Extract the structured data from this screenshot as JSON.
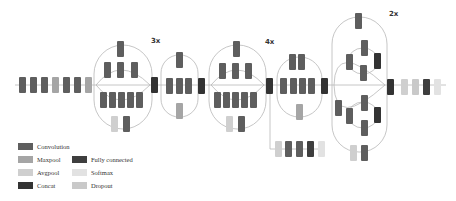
{
  "colors": {
    "convolution": "#5e5e5e",
    "maxpool": "#a5a5a5",
    "avgpool": "#cfcfcf",
    "concat": "#333333",
    "fully_connected": "#3e3e3e",
    "softmax": "#e2e2e2",
    "dropout": "#c9c9c9",
    "line": "#b0b0b0"
  },
  "labels": {
    "inception_a_repeat": "3x",
    "inception_b_repeat": "4x",
    "inception_c_repeat": "2x"
  },
  "legend": {
    "items": [
      {
        "label": "Convolution",
        "type": "convolution"
      },
      {
        "label": "Maxpool",
        "type": "maxpool"
      },
      {
        "label": "Avgpool",
        "type": "avgpool"
      },
      {
        "label": "Concat",
        "type": "concat"
      },
      {
        "label": "Fully connected",
        "type": "fully_connected"
      },
      {
        "label": "Softmax",
        "type": "softmax"
      },
      {
        "label": "Dropout",
        "type": "dropout"
      }
    ]
  },
  "blocks": [
    {
      "section": "stem",
      "type": "convolution",
      "x": 19,
      "y": 77
    },
    {
      "section": "stem",
      "type": "convolution",
      "x": 30,
      "y": 77
    },
    {
      "section": "stem",
      "type": "convolution",
      "x": 41,
      "y": 77
    },
    {
      "section": "stem",
      "type": "maxpool",
      "x": 52,
      "y": 77
    },
    {
      "section": "stem",
      "type": "convolution",
      "x": 63,
      "y": 77
    },
    {
      "section": "stem",
      "type": "convolution",
      "x": 74,
      "y": 77
    },
    {
      "section": "stem",
      "type": "maxpool",
      "x": 85,
      "y": 77
    },
    {
      "section": "inception-a",
      "type": "convolution",
      "x": 117,
      "y": 41
    },
    {
      "section": "inception-a",
      "type": "convolution",
      "x": 104,
      "y": 62
    },
    {
      "section": "inception-a",
      "type": "convolution",
      "x": 117,
      "y": 62
    },
    {
      "section": "inception-a",
      "type": "convolution",
      "x": 131,
      "y": 62
    },
    {
      "section": "inception-a",
      "type": "convolution",
      "x": 100,
      "y": 92
    },
    {
      "section": "inception-a",
      "type": "convolution",
      "x": 109,
      "y": 92
    },
    {
      "section": "inception-a",
      "type": "convolution",
      "x": 118,
      "y": 92
    },
    {
      "section": "inception-a",
      "type": "convolution",
      "x": 127,
      "y": 92
    },
    {
      "section": "inception-a",
      "type": "convolution",
      "x": 136,
      "y": 92
    },
    {
      "section": "inception-a",
      "type": "avgpool",
      "x": 111,
      "y": 116
    },
    {
      "section": "inception-a",
      "type": "convolution",
      "x": 123,
      "y": 116
    },
    {
      "section": "inception-a",
      "type": "concat",
      "x": 151,
      "y": 77
    },
    {
      "section": "reduction-a",
      "type": "convolution",
      "x": 176,
      "y": 52
    },
    {
      "section": "reduction-a",
      "type": "convolution",
      "x": 166,
      "y": 78
    },
    {
      "section": "reduction-a",
      "type": "convolution",
      "x": 176,
      "y": 78
    },
    {
      "section": "reduction-a",
      "type": "convolution",
      "x": 185,
      "y": 78
    },
    {
      "section": "reduction-a",
      "type": "maxpool",
      "x": 176,
      "y": 103
    },
    {
      "section": "reduction-a",
      "type": "concat",
      "x": 198,
      "y": 78
    },
    {
      "section": "inception-b",
      "type": "convolution",
      "x": 233,
      "y": 41
    },
    {
      "section": "inception-b",
      "type": "convolution",
      "x": 219,
      "y": 63
    },
    {
      "section": "inception-b",
      "type": "convolution",
      "x": 232,
      "y": 63
    },
    {
      "section": "inception-b",
      "type": "convolution",
      "x": 245,
      "y": 63
    },
    {
      "section": "inception-b",
      "type": "convolution",
      "x": 214,
      "y": 92
    },
    {
      "section": "inception-b",
      "type": "convolution",
      "x": 223,
      "y": 92
    },
    {
      "section": "inception-b",
      "type": "convolution",
      "x": 232,
      "y": 92
    },
    {
      "section": "inception-b",
      "type": "convolution",
      "x": 241,
      "y": 92
    },
    {
      "section": "inception-b",
      "type": "convolution",
      "x": 250,
      "y": 92
    },
    {
      "section": "inception-b",
      "type": "avgpool",
      "x": 226,
      "y": 116
    },
    {
      "section": "inception-b",
      "type": "convolution",
      "x": 238,
      "y": 116
    },
    {
      "section": "inception-b",
      "type": "concat",
      "x": 266,
      "y": 78
    },
    {
      "section": "auxiliary",
      "type": "avgpool",
      "x": 275,
      "y": 141
    },
    {
      "section": "auxiliary",
      "type": "convolution",
      "x": 285,
      "y": 141
    },
    {
      "section": "auxiliary",
      "type": "convolution",
      "x": 296,
      "y": 141
    },
    {
      "section": "auxiliary",
      "type": "fully_connected",
      "x": 307,
      "y": 141
    },
    {
      "section": "auxiliary",
      "type": "softmax",
      "x": 318,
      "y": 141
    },
    {
      "section": "reduction-b",
      "type": "convolution",
      "x": 289,
      "y": 54
    },
    {
      "section": "reduction-b",
      "type": "convolution",
      "x": 298,
      "y": 54
    },
    {
      "section": "reduction-b",
      "type": "convolution",
      "x": 280,
      "y": 78
    },
    {
      "section": "reduction-b",
      "type": "convolution",
      "x": 290,
      "y": 78
    },
    {
      "section": "reduction-b",
      "type": "convolution",
      "x": 299,
      "y": 78
    },
    {
      "section": "reduction-b",
      "type": "convolution",
      "x": 308,
      "y": 78
    },
    {
      "section": "reduction-b",
      "type": "maxpool",
      "x": 296,
      "y": 104
    },
    {
      "section": "reduction-b",
      "type": "concat",
      "x": 321,
      "y": 78
    },
    {
      "section": "inception-c",
      "type": "convolution",
      "x": 355,
      "y": 13
    },
    {
      "section": "inception-c",
      "type": "convolution",
      "x": 346,
      "y": 54
    },
    {
      "section": "inception-c",
      "type": "convolution",
      "x": 361,
      "y": 40
    },
    {
      "section": "inception-c",
      "type": "convolution",
      "x": 360,
      "y": 65
    },
    {
      "section": "inception-c",
      "type": "concat",
      "x": 374,
      "y": 53
    },
    {
      "section": "inception-c",
      "type": "convolution",
      "x": 335,
      "y": 100
    },
    {
      "section": "inception-c",
      "type": "convolution",
      "x": 346,
      "y": 108
    },
    {
      "section": "inception-c",
      "type": "convolution",
      "x": 361,
      "y": 95
    },
    {
      "section": "inception-c",
      "type": "convolution",
      "x": 361,
      "y": 120
    },
    {
      "section": "inception-c",
      "type": "concat",
      "x": 374,
      "y": 107
    },
    {
      "section": "inception-c",
      "type": "avgpool",
      "x": 350,
      "y": 145
    },
    {
      "section": "inception-c",
      "type": "convolution",
      "x": 361,
      "y": 145
    },
    {
      "section": "inception-c",
      "type": "concat",
      "x": 387,
      "y": 79
    },
    {
      "section": "output",
      "type": "avgpool",
      "x": 401,
      "y": 79
    },
    {
      "section": "output",
      "type": "dropout",
      "x": 412,
      "y": 79
    },
    {
      "section": "output",
      "type": "fully_connected",
      "x": 423,
      "y": 79
    },
    {
      "section": "output",
      "type": "softmax",
      "x": 434,
      "y": 79
    }
  ]
}
